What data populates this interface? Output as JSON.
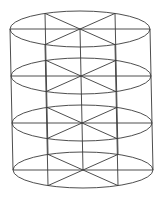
{
  "figure": {
    "type": "wireframe-cylinder",
    "background": "#ffffff",
    "stroke_color": "#3a3a3a",
    "stroke_width": 0.9,
    "ellipse": {
      "rx": 70,
      "ry": 18
    },
    "spokes_per_level": 6,
    "spoke_angles_deg": [
      0,
      60,
      120,
      180,
      240,
      300
    ],
    "levels": [
      {
        "cx": 80,
        "cy": 29
      },
      {
        "cx": 81,
        "cy": 76
      },
      {
        "cx": 82,
        "cy": 123
      },
      {
        "cx": 83,
        "cy": 170
      }
    ],
    "vertical_angles_deg": [
      0,
      180,
      60,
      120,
      240,
      300
    ],
    "central_axis": true
  }
}
